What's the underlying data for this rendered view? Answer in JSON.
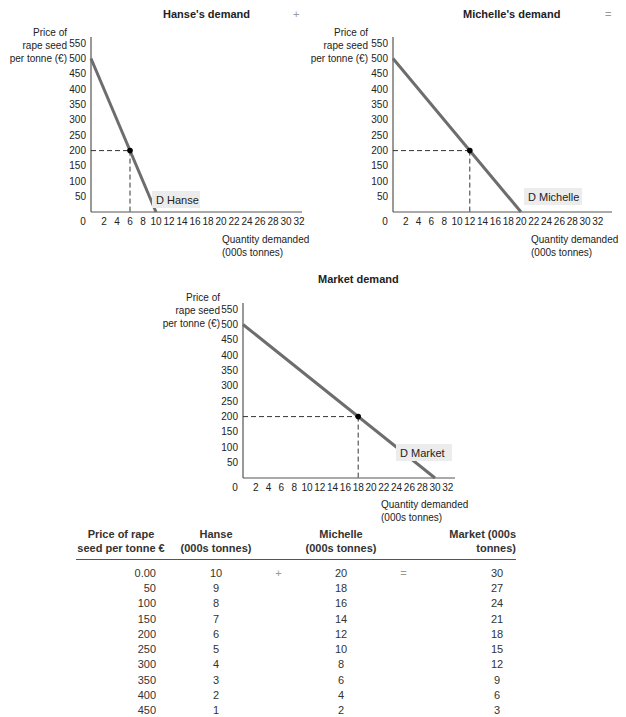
{
  "charts": {
    "hanse": {
      "title": "Hanse's demand",
      "operator": "+",
      "ylabel": [
        "Price of",
        "rape seed",
        "per tonne (€)"
      ],
      "xlabel": [
        "Quantity demanded",
        "(000s tonnes)"
      ],
      "curve_label": "D Hanse"
    },
    "michelle": {
      "title": "Michelle's demand",
      "operator": "=",
      "ylabel": [
        "Price of",
        "rape seed",
        "per tonne (€)"
      ],
      "xlabel": [
        "Quantity demanded",
        "(000s tonnes)"
      ],
      "curve_label": "D Michelle"
    },
    "market": {
      "title": "Market demand",
      "ylabel": [
        "Price of",
        "rape seed",
        "per tonne (€)"
      ],
      "xlabel": [
        "Quantity demanded",
        "(000s tonnes)"
      ],
      "curve_label": "D Market"
    }
  },
  "table": {
    "headers": {
      "price": [
        "Price of rape",
        "seed per tonne €"
      ],
      "hanse": [
        "Hanse",
        "(000s tonnes)"
      ],
      "michelle": [
        "Michelle",
        "(000s tonnes)"
      ],
      "market": [
        "Market (000s tonnes)"
      ]
    },
    "plus": "+",
    "equals": "=",
    "rows": [
      {
        "price": "0.00",
        "hanse": "10",
        "michelle": "20",
        "market": "30"
      },
      {
        "price": "50",
        "hanse": "9",
        "michelle": "18",
        "market": "27"
      },
      {
        "price": "100",
        "hanse": "8",
        "michelle": "16",
        "market": "24"
      },
      {
        "price": "150",
        "hanse": "7",
        "michelle": "14",
        "market": "21"
      },
      {
        "price": "200",
        "hanse": "6",
        "michelle": "12",
        "market": "18"
      },
      {
        "price": "250",
        "hanse": "5",
        "michelle": "10",
        "market": "15"
      },
      {
        "price": "300",
        "hanse": "4",
        "michelle": "8",
        "market": "12"
      },
      {
        "price": "350",
        "hanse": "3",
        "michelle": "6",
        "market": "9"
      },
      {
        "price": "400",
        "hanse": "2",
        "michelle": "4",
        "market": "6"
      },
      {
        "price": "450",
        "hanse": "1",
        "michelle": "2",
        "market": "3"
      }
    ]
  },
  "colors": {
    "line": "#6d6d6d",
    "label_bg": "#ececec",
    "axis": "#555555"
  },
  "chart_data": [
    {
      "type": "line",
      "title": "Hanse's demand",
      "xlabel": "Quantity demanded (000s tonnes)",
      "ylabel": "Price of rape seed per tonne (€)",
      "x_ticks": [
        0,
        2,
        4,
        6,
        8,
        10,
        12,
        14,
        16,
        18,
        20,
        22,
        24,
        26,
        28,
        30,
        32
      ],
      "y_ticks": [
        50,
        100,
        150,
        200,
        250,
        300,
        350,
        400,
        450,
        500,
        550
      ],
      "xlim": [
        0,
        32
      ],
      "ylim": [
        0,
        550
      ],
      "series": [
        {
          "name": "D Hanse",
          "x": [
            0,
            10
          ],
          "y": [
            500,
            0
          ]
        }
      ],
      "annotations": [
        {
          "point": [
            6,
            200
          ],
          "dashed_guides": true
        }
      ]
    },
    {
      "type": "line",
      "title": "Michelle's demand",
      "xlabel": "Quantity demanded (000s tonnes)",
      "ylabel": "Price of rape seed per tonne (€)",
      "x_ticks": [
        0,
        2,
        4,
        6,
        8,
        10,
        12,
        14,
        16,
        18,
        20,
        22,
        24,
        26,
        28,
        30,
        32
      ],
      "y_ticks": [
        50,
        100,
        150,
        200,
        250,
        300,
        350,
        400,
        450,
        500,
        550
      ],
      "xlim": [
        0,
        32
      ],
      "ylim": [
        0,
        550
      ],
      "series": [
        {
          "name": "D Michelle",
          "x": [
            0,
            20
          ],
          "y": [
            500,
            0
          ]
        }
      ],
      "annotations": [
        {
          "point": [
            12,
            200
          ],
          "dashed_guides": true
        }
      ]
    },
    {
      "type": "line",
      "title": "Market demand",
      "xlabel": "Quantity demanded (000s tonnes)",
      "ylabel": "Price of rape seed per tonne (€)",
      "x_ticks": [
        0,
        2,
        4,
        6,
        8,
        10,
        12,
        14,
        16,
        18,
        20,
        22,
        24,
        26,
        28,
        30,
        32
      ],
      "y_ticks": [
        50,
        100,
        150,
        200,
        250,
        300,
        350,
        400,
        450,
        500,
        550
      ],
      "xlim": [
        0,
        32
      ],
      "ylim": [
        0,
        550
      ],
      "series": [
        {
          "name": "D Market",
          "x": [
            0,
            30
          ],
          "y": [
            500,
            0
          ]
        }
      ],
      "annotations": [
        {
          "point": [
            18,
            200
          ],
          "dashed_guides": true
        }
      ]
    },
    {
      "type": "table",
      "columns": [
        "Price of rape seed per tonne €",
        "Hanse (000s tonnes)",
        "Michelle (000s tonnes)",
        "Market (000s tonnes)"
      ],
      "rows": [
        [
          0,
          10,
          20,
          30
        ],
        [
          50,
          9,
          18,
          27
        ],
        [
          100,
          8,
          16,
          24
        ],
        [
          150,
          7,
          14,
          21
        ],
        [
          200,
          6,
          12,
          18
        ],
        [
          250,
          5,
          10,
          15
        ],
        [
          300,
          4,
          8,
          12
        ],
        [
          350,
          3,
          6,
          9
        ],
        [
          400,
          2,
          4,
          6
        ],
        [
          450,
          1,
          2,
          3
        ]
      ]
    }
  ]
}
